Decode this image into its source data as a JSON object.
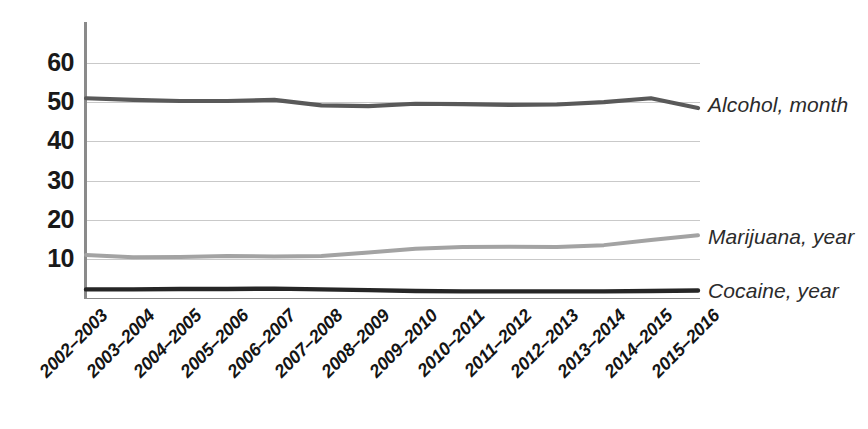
{
  "chart_data": {
    "type": "line",
    "title": "",
    "subtitle": "",
    "xlabel": "",
    "ylabel": "",
    "ylim": [
      0,
      66
    ],
    "yticks": [
      10,
      20,
      30,
      40,
      50,
      60
    ],
    "grid": true,
    "legend_position": "right-of-plot-inline",
    "categories": [
      "2002–2003",
      "2003–2004",
      "2004–2005",
      "2005–2006",
      "2006–2007",
      "2007–2008",
      "2008–2009",
      "2009–2010",
      "2010–2011",
      "2011–2012",
      "2012–2013",
      "2013–2014",
      "2014–2015",
      "2015–2016"
    ],
    "series": [
      {
        "name": "Alcohol, month",
        "color": "#595959",
        "values": [
          51.0,
          50.6,
          50.3,
          50.3,
          50.6,
          49.2,
          49.0,
          49.6,
          49.5,
          49.3,
          49.4,
          50.0,
          51.0,
          48.5
        ]
      },
      {
        "name": "Marijuana, year",
        "color": "#a3a3a3",
        "values": [
          11.0,
          10.4,
          10.5,
          10.7,
          10.6,
          10.7,
          11.6,
          12.6,
          13.0,
          13.1,
          13.0,
          13.5,
          14.8,
          16.0
        ]
      },
      {
        "name": "Cocaine, year",
        "color": "#262626",
        "values": [
          2.2,
          2.2,
          2.3,
          2.3,
          2.4,
          2.2,
          2.0,
          1.8,
          1.7,
          1.7,
          1.7,
          1.7,
          1.8,
          1.9
        ]
      }
    ]
  },
  "axis": {
    "y_tick_labels": [
      "60",
      "50",
      "40",
      "30",
      "20",
      "10"
    ]
  },
  "legend": {
    "items": [
      {
        "label": "Alcohol, month",
        "color": "#595959"
      },
      {
        "label": "Marijuana, year",
        "color": "#a3a3a3"
      },
      {
        "label": "Cocaine, year",
        "color": "#262626"
      }
    ]
  }
}
